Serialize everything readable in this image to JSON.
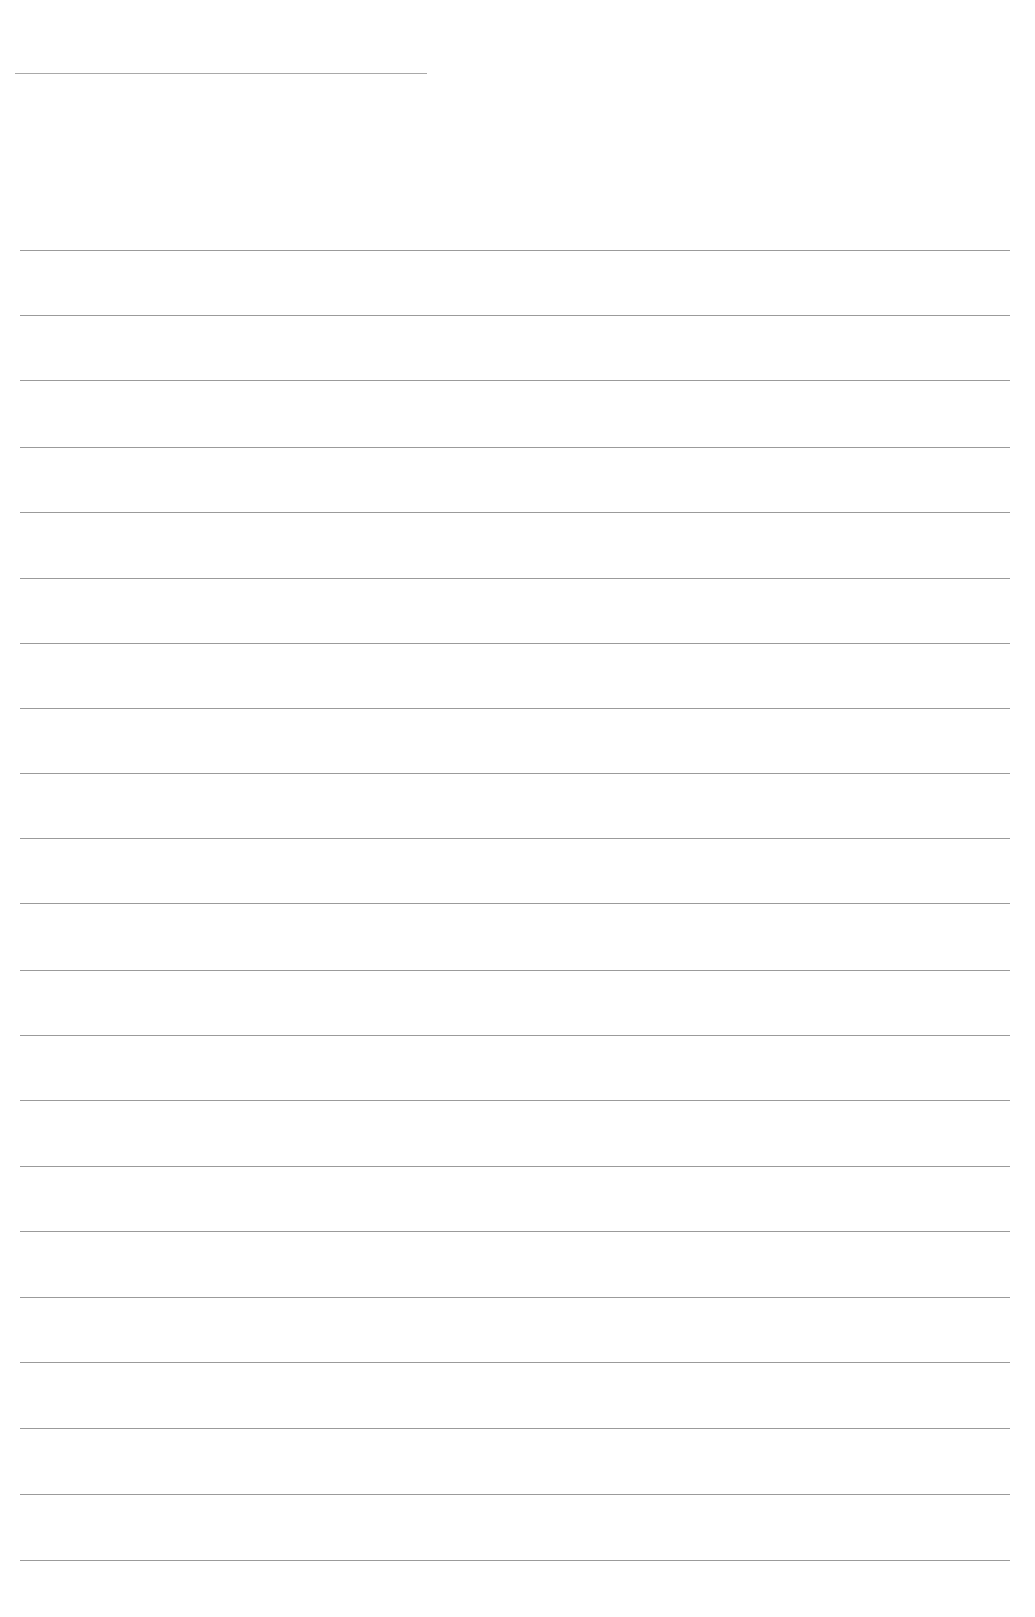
{
  "page": {
    "type": "blank-ruled-sheet",
    "background": "#ffffff",
    "line_color": "#8a8a8a",
    "header_line": {
      "y": 73,
      "x1": 15,
      "x2": 427
    },
    "ruled_lines": {
      "x1": 20,
      "x2": 1010,
      "y": [
        250,
        315,
        380,
        447,
        512,
        578,
        643,
        708,
        773,
        838,
        903,
        970,
        1035,
        1100,
        1166,
        1231,
        1297,
        1362,
        1428,
        1494,
        1560
      ]
    },
    "text": []
  }
}
